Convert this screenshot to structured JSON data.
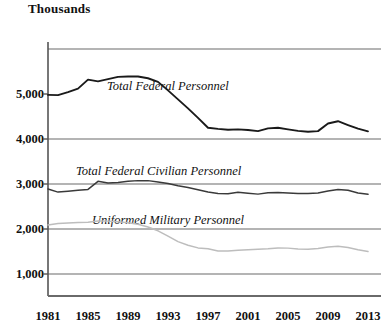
{
  "chart_data": {
    "type": "line",
    "title": "",
    "unit_label": "Thousands",
    "xlabel": "",
    "ylabel": "Thousands",
    "grid": true,
    "legend_position": "inline-annotations",
    "xlim": [
      1981,
      2013
    ],
    "ylim": [
      0,
      6000
    ],
    "x_ticks": [
      "1981",
      "1985",
      "1989",
      "1993",
      "1997",
      "2001",
      "2005",
      "2009",
      "2013"
    ],
    "x_tick_values": [
      1981,
      1985,
      1989,
      1993,
      1997,
      2001,
      2005,
      2009,
      2013
    ],
    "y_ticks": [
      "1,000",
      "2,000",
      "3,000",
      "4,000",
      "5,000"
    ],
    "y_tick_values": [
      1000,
      2000,
      3000,
      4000,
      5000
    ],
    "y_gridlines": [
      1000,
      2000,
      3000,
      4000,
      6000
    ],
    "x": [
      1981,
      1982,
      1983,
      1984,
      1985,
      1986,
      1987,
      1988,
      1989,
      1990,
      1991,
      1992,
      1993,
      1994,
      1995,
      1996,
      1997,
      1998,
      1999,
      2000,
      2001,
      2002,
      2003,
      2004,
      2005,
      2006,
      2007,
      2008,
      2009,
      2010,
      2011,
      2012,
      2013
    ],
    "series": [
      {
        "name": "Total Federal Personnel",
        "color": "#1a1a1a",
        "label_x": 1993,
        "label_y": 5150,
        "values": [
          4980,
          4975,
          5040,
          5120,
          5320,
          5280,
          5330,
          5380,
          5390,
          5390,
          5350,
          5270,
          5080,
          4880,
          4680,
          4470,
          4250,
          4225,
          4205,
          4215,
          4200,
          4175,
          4235,
          4250,
          4215,
          4180,
          4160,
          4175,
          4345,
          4395,
          4310,
          4230,
          4170
        ]
      },
      {
        "name": "Total Federal Civilian Personnel",
        "color": "#3a3a3a",
        "label_x": 1992,
        "label_y": 3270,
        "values": [
          2890,
          2820,
          2840,
          2860,
          2880,
          3060,
          3020,
          3035,
          3060,
          3075,
          3075,
          3045,
          3010,
          2960,
          2920,
          2870,
          2820,
          2790,
          2785,
          2815,
          2795,
          2775,
          2805,
          2810,
          2800,
          2790,
          2790,
          2800,
          2845,
          2880,
          2860,
          2800,
          2770
        ]
      },
      {
        "name": "Uniformed Military Personnel",
        "color": "#bdbdbd",
        "label_x": 1993,
        "label_y": 2180,
        "values": [
          2090,
          2120,
          2135,
          2145,
          2150,
          2180,
          2175,
          2160,
          2140,
          2105,
          2045,
          1960,
          1840,
          1720,
          1640,
          1580,
          1560,
          1510,
          1510,
          1530,
          1540,
          1550,
          1560,
          1580,
          1575,
          1555,
          1550,
          1565,
          1600,
          1615,
          1590,
          1540,
          1500
        ]
      }
    ]
  }
}
